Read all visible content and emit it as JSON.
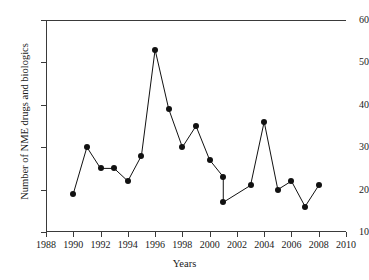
{
  "chart_data": {
    "type": "line",
    "title": "",
    "xlabel": "Years",
    "ylabel": "Number of NME drugs and biologics",
    "xlim": [
      1988,
      2010
    ],
    "ylim": [
      10,
      60
    ],
    "xticks": [
      1988,
      1990,
      1992,
      1994,
      1996,
      1998,
      2000,
      2002,
      2004,
      2006,
      2008,
      2010
    ],
    "yticks": [
      10,
      20,
      30,
      40,
      50,
      60
    ],
    "grid": false,
    "legend": "none",
    "marker": "filled-circle",
    "line_color": "#111111",
    "marker_color": "#111111",
    "x": [
      1990,
      1991,
      1992,
      1993,
      1994,
      1995,
      1996,
      1997,
      1998,
      1999,
      2000,
      2001,
      2001,
      2003,
      2004,
      2005,
      2006,
      2007,
      2008
    ],
    "values": [
      19,
      30,
      25,
      25,
      22,
      28,
      53,
      39,
      30,
      35,
      27,
      23,
      17,
      21,
      36,
      20,
      22,
      16,
      21
    ],
    "points": [
      {
        "x": 1990,
        "y": 19
      },
      {
        "x": 1991,
        "y": 30
      },
      {
        "x": 1992,
        "y": 25
      },
      {
        "x": 1993,
        "y": 25
      },
      {
        "x": 1994,
        "y": 22
      },
      {
        "x": 1995,
        "y": 28
      },
      {
        "x": 1996,
        "y": 53
      },
      {
        "x": 1997,
        "y": 39
      },
      {
        "x": 1998,
        "y": 30
      },
      {
        "x": 1999,
        "y": 35
      },
      {
        "x": 2000,
        "y": 27
      },
      {
        "x": 2001,
        "y": 23
      },
      {
        "x": 2001,
        "y": 17
      },
      {
        "x": 2003,
        "y": 21
      },
      {
        "x": 2004,
        "y": 36
      },
      {
        "x": 2005,
        "y": 20
      },
      {
        "x": 2006,
        "y": 22
      },
      {
        "x": 2007,
        "y": 16
      },
      {
        "x": 2008,
        "y": 21
      }
    ]
  }
}
